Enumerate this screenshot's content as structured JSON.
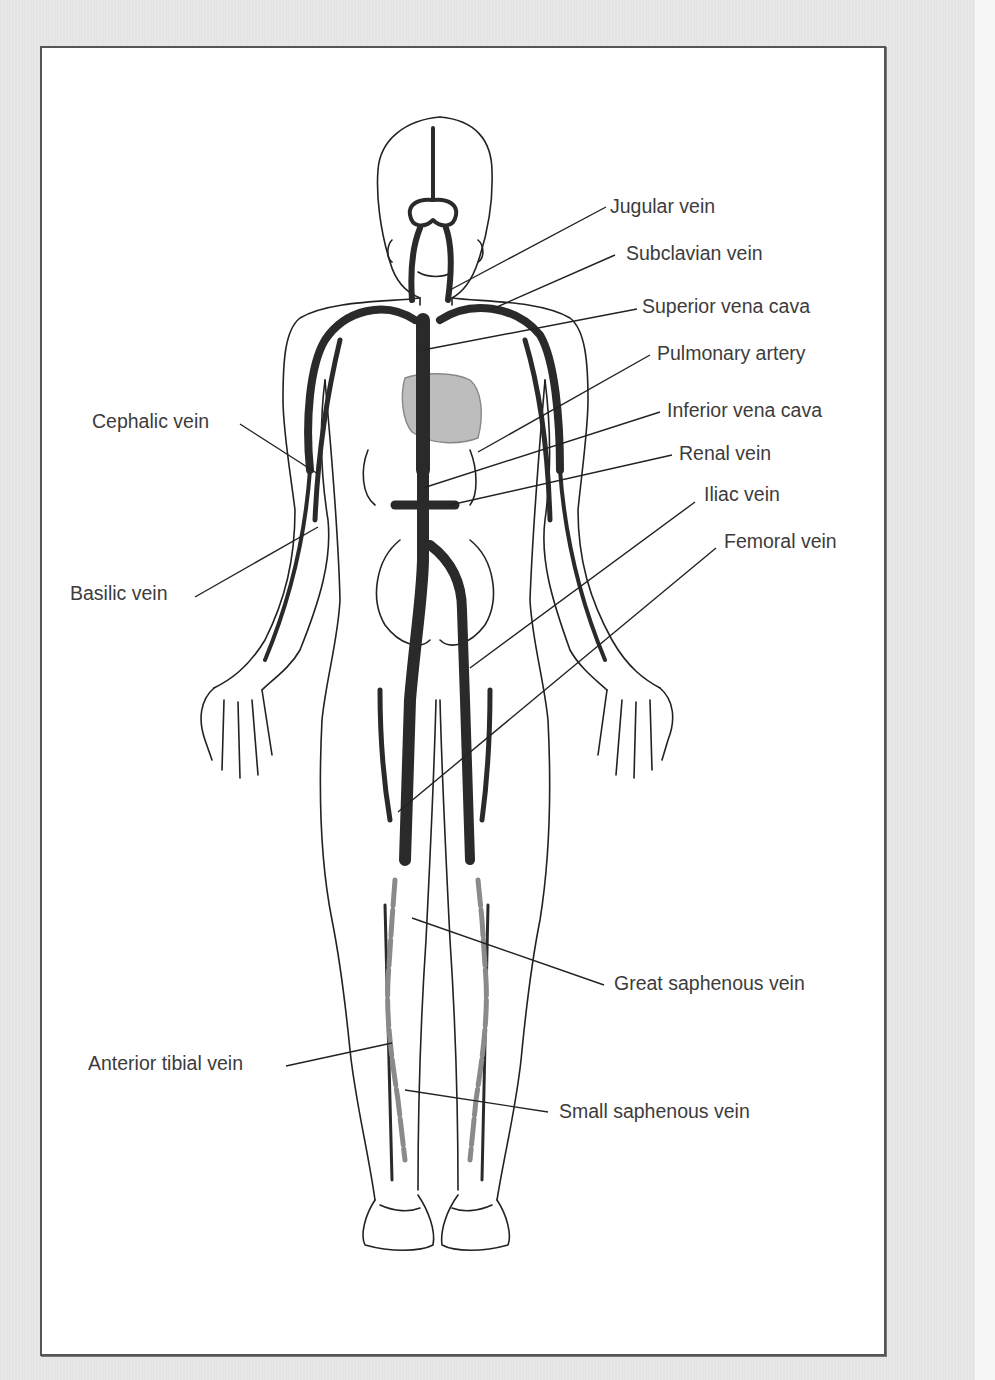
{
  "figure": {
    "colors": {
      "page_background": "#e6e6e6",
      "figure_background": "#ffffff",
      "frame_border": "#555555",
      "vein_dark": "#2a2a2a",
      "vein_gray": "#8a8a8a",
      "heart_fill": "#bdbdbd",
      "outline": "#222222",
      "label_text": "#3c3c3c"
    }
  },
  "labels": {
    "right": [
      {
        "id": "jugular",
        "text": "Jugular vein",
        "x": 610,
        "y": 197
      },
      {
        "id": "subclavian",
        "text": "Subclavian vein",
        "x": 626,
        "y": 244
      },
      {
        "id": "superior_vena_cava",
        "text": "Superior vena cava",
        "x": 642,
        "y": 297
      },
      {
        "id": "pulmonary_artery",
        "text": "Pulmonary artery",
        "x": 657,
        "y": 344
      },
      {
        "id": "inferior_vena_cava",
        "text": "Inferior vena cava",
        "x": 667,
        "y": 401
      },
      {
        "id": "renal",
        "text": "Renal vein",
        "x": 679,
        "y": 444
      },
      {
        "id": "iliac",
        "text": "Iliac vein",
        "x": 704,
        "y": 485
      },
      {
        "id": "femoral",
        "text": "Femoral vein",
        "x": 724,
        "y": 532
      },
      {
        "id": "great_saphenous",
        "text": "Great saphenous vein",
        "x": 614,
        "y": 974
      },
      {
        "id": "small_saphenous",
        "text": "Small saphenous vein",
        "x": 559,
        "y": 1102
      }
    ],
    "left": [
      {
        "id": "cephalic",
        "text": "Cephalic vein",
        "x": 92,
        "y": 412
      },
      {
        "id": "basilic",
        "text": "Basilic vein",
        "x": 70,
        "y": 584
      },
      {
        "id": "anterior_tibial",
        "text": "Anterior tibial vein",
        "x": 88,
        "y": 1054
      }
    ]
  }
}
